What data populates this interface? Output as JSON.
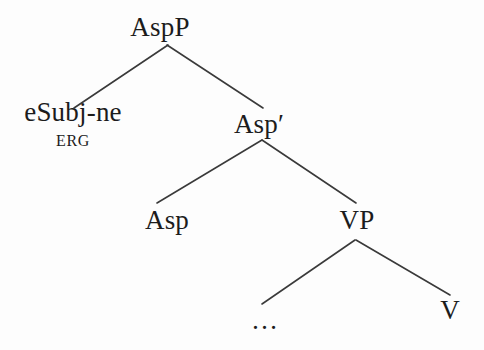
{
  "figure": {
    "type": "syntax-tree",
    "background_color": "#fdfdfd",
    "line_color": "#3a3a3a",
    "text_color": "#1c1c1c"
  },
  "nodes": {
    "root": {
      "label": "AspP",
      "x": 160,
      "y": 27
    },
    "specifier": {
      "label": "eSubj-ne",
      "gloss": "ERG",
      "x": 73,
      "y": 124
    },
    "asp_bar": {
      "label": "Asp′",
      "x": 259,
      "y": 124
    },
    "asp_head": {
      "label": "Asp",
      "x": 167,
      "y": 220
    },
    "vp": {
      "label": "VP",
      "x": 357,
      "y": 220
    },
    "ellipsis": {
      "label": "…",
      "x": 265,
      "y": 320
    },
    "verb": {
      "label": "V",
      "x": 450,
      "y": 310
    }
  },
  "branches": [
    {
      "name": "aspp-to-esubj",
      "x1": 168,
      "y1": 45,
      "x2": 74,
      "y2": 108
    },
    {
      "name": "aspp-to-aspbar",
      "x1": 167,
      "y1": 45,
      "x2": 263,
      "y2": 108
    },
    {
      "name": "aspbar-to-asp",
      "x1": 262,
      "y1": 140,
      "x2": 157,
      "y2": 203
    },
    {
      "name": "aspbar-to-vp",
      "x1": 262,
      "y1": 140,
      "x2": 356,
      "y2": 203
    },
    {
      "name": "vp-to-ellipsis",
      "x1": 355,
      "y1": 240,
      "x2": 262,
      "y2": 304
    },
    {
      "name": "vp-to-v",
      "x1": 356,
      "y1": 240,
      "x2": 450,
      "y2": 295
    }
  ]
}
